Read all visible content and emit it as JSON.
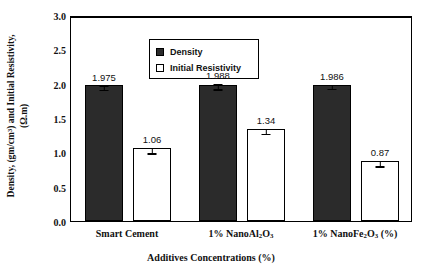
{
  "chart_data": {
    "type": "bar",
    "title": "",
    "xlabel": "Additives Concentrations (%)",
    "ylabel_line1": "Density, (gm/cm",
    "ylabel_line1_sup": "3",
    "ylabel_line1_tail": ") and  Initial Resistivity,",
    "ylabel_line2": "(Ω.m)",
    "categories": [
      "Smart Cement",
      "1% NanoAl2O3",
      "1% NanoFe2O3 (%)"
    ],
    "category_labels": [
      {
        "pre": "Smart Cement",
        "sub1": "",
        "mid": "",
        "sub2": "",
        "post": ""
      },
      {
        "pre": "1% NanoAl",
        "sub1": "2",
        "mid": "O",
        "sub2": "3",
        "post": ""
      },
      {
        "pre": "1% NanoFe",
        "sub1": "2",
        "mid": "O",
        "sub2": "3",
        "post": " (%)"
      }
    ],
    "ylim": [
      0.0,
      3.0
    ],
    "yticks": [
      "0.0",
      "0.5",
      "1.0",
      "1.5",
      "2.0",
      "2.5",
      "3.0"
    ],
    "ytick_values": [
      0.0,
      0.5,
      1.0,
      1.5,
      2.0,
      2.5,
      3.0
    ],
    "grid": false,
    "legend_position": "upper-left",
    "series": [
      {
        "name": "Density",
        "swatch": "filled",
        "values": [
          1.975,
          1.988,
          1.986
        ],
        "value_labels": [
          "1.975",
          "1.988",
          "1.986"
        ],
        "errors": [
          0.04,
          0.045,
          0.04
        ]
      },
      {
        "name": "Initial Resistivity",
        "swatch": "open",
        "values": [
          1.06,
          1.34,
          0.87
        ],
        "value_labels": [
          "1.06",
          "1.34",
          "0.87"
        ],
        "errors": [
          0.05,
          0.05,
          0.05
        ]
      }
    ],
    "colors": {
      "density_bar": "#2b2b2b",
      "resistivity_bar": "#ffffff",
      "axis": "#000000",
      "text": "#111111"
    }
  }
}
